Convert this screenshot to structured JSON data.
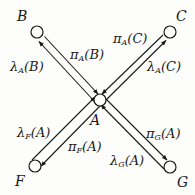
{
  "diagram": {
    "type": "message-passing-graph",
    "center_node": "A",
    "nodes": [
      {
        "id": "A",
        "label": "A",
        "cx": 100,
        "cy": 100
      },
      {
        "id": "B",
        "label": "B",
        "cx": 37,
        "cy": 32
      },
      {
        "id": "C",
        "label": "C",
        "cx": 170,
        "cy": 32
      },
      {
        "id": "F",
        "label": "F",
        "cx": 35,
        "cy": 166
      },
      {
        "id": "G",
        "label": "G",
        "cx": 170,
        "cy": 167
      }
    ],
    "messages": [
      {
        "id": "lambda_A_B",
        "symbol": "λ",
        "sub": "A",
        "arg": "(B)",
        "from": "A",
        "to": "B"
      },
      {
        "id": "pi_A_B",
        "symbol": "π",
        "sub": "A",
        "arg": "(B)",
        "from": "B",
        "to": "A"
      },
      {
        "id": "pi_A_C",
        "symbol": "π",
        "sub": "A",
        "arg": "(C)",
        "from": "C",
        "to": "A"
      },
      {
        "id": "lambda_A_C",
        "symbol": "λ",
        "sub": "A",
        "arg": "(C)",
        "from": "A",
        "to": "C"
      },
      {
        "id": "lambda_F_A",
        "symbol": "λ",
        "sub": "F",
        "arg": "(A)",
        "from": "F",
        "to": "A"
      },
      {
        "id": "pi_F_A",
        "symbol": "π",
        "sub": "F",
        "arg": "(A)",
        "from": "A",
        "to": "F"
      },
      {
        "id": "pi_G_A",
        "symbol": "π",
        "sub": "G",
        "arg": "(A)",
        "from": "A",
        "to": "G"
      },
      {
        "id": "lambda_G_A",
        "symbol": "λ",
        "sub": "G",
        "arg": "(A)",
        "from": "G",
        "to": "A"
      }
    ],
    "colors": {
      "ink": "#1a1a1a",
      "paper": "#fdfdfb"
    }
  }
}
